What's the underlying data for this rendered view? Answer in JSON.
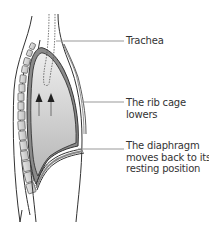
{
  "diagram": {
    "type": "anatomical-illustration",
    "labels": {
      "trachea": "Trachea",
      "rib_cage": {
        "line1": "The rib cage",
        "line2": "lowers"
      },
      "diaphragm": {
        "line1": "The diaphragm",
        "line2": "moves back to its",
        "line3": "resting position"
      }
    },
    "arrows": {
      "count": 2,
      "direction": "up",
      "meaning": "air moving out"
    },
    "colors": {
      "outline": "#333333",
      "lung_fill_top": "#e4e4e4",
      "lung_fill_bottom": "#b8b8b8",
      "pleura": "#888888",
      "vertebra_fill": "#d0d0d0",
      "leader_line": "#999999",
      "text": "#333333"
    }
  }
}
